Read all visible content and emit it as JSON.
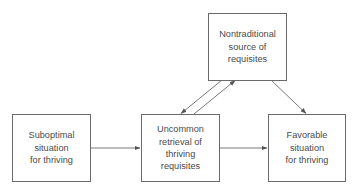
{
  "diagram": {
    "type": "flow-diagram",
    "nodes": [
      {
        "id": "suboptimal",
        "label": "Suboptimal\nsituation\nfor thriving"
      },
      {
        "id": "uncommon",
        "label": "Uncommon\nretrieval of\nthriving\nrequisites"
      },
      {
        "id": "favorable",
        "label": "Favorable\nsituation\nfor thriving"
      },
      {
        "id": "nontraditional",
        "label": "Nontraditional\nsource of\nrequisites"
      }
    ],
    "edges": [
      {
        "from": "suboptimal",
        "to": "uncommon"
      },
      {
        "from": "uncommon",
        "to": "favorable"
      },
      {
        "from": "nontraditional",
        "to": "uncommon"
      },
      {
        "from": "uncommon",
        "to": "nontraditional"
      },
      {
        "from": "nontraditional",
        "to": "favorable"
      }
    ],
    "colors": {
      "stroke": "#6a6a6a",
      "text": "#4a4a4a",
      "background": "#ffffff"
    }
  }
}
